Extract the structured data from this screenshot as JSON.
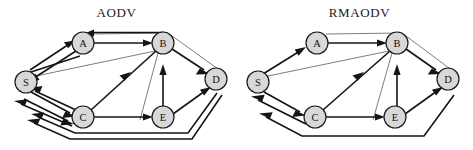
{
  "figure": {
    "type": "network-routing-diagram",
    "panels": [
      {
        "id": "aodv",
        "title": "AODV",
        "nodes": [
          {
            "id": "S",
            "label": "S",
            "x": 26,
            "y": 82,
            "r": 11
          },
          {
            "id": "A",
            "label": "A",
            "x": 83,
            "y": 43,
            "r": 11
          },
          {
            "id": "B",
            "label": "B",
            "x": 163,
            "y": 43,
            "r": 11
          },
          {
            "id": "C",
            "label": "C",
            "x": 83,
            "y": 117,
            "r": 11
          },
          {
            "id": "E",
            "label": "E",
            "x": 163,
            "y": 117,
            "r": 11
          },
          {
            "id": "D",
            "label": "D",
            "x": 216,
            "y": 79,
            "r": 11
          }
        ],
        "edges": [
          {
            "from": "S",
            "to": "A",
            "style": "bold",
            "direction": "forward"
          },
          {
            "from": "A",
            "to": "S",
            "style": "bold",
            "direction": "forward"
          },
          {
            "from": "A",
            "to": "S",
            "style": "bold",
            "direction": "forward"
          },
          {
            "from": "A",
            "to": "B",
            "style": "bold",
            "direction": "forward"
          },
          {
            "from": "B",
            "to": "A",
            "style": "bold",
            "direction": "forward"
          },
          {
            "from": "S",
            "to": "C",
            "style": "bold",
            "direction": "forward"
          },
          {
            "from": "S",
            "to": "C",
            "style": "bold",
            "direction": "forward"
          },
          {
            "from": "C",
            "to": "S",
            "style": "bold",
            "direction": "forward"
          },
          {
            "from": "C",
            "to": "S",
            "style": "bold",
            "direction": "forward"
          },
          {
            "from": "C",
            "to": "B",
            "style": "bold",
            "direction": "forward"
          },
          {
            "from": "C",
            "to": "E",
            "style": "bold",
            "direction": "forward"
          },
          {
            "from": "E",
            "to": "B",
            "style": "bold",
            "direction": "forward"
          },
          {
            "from": "B",
            "to": "D",
            "style": "bold",
            "direction": "forward"
          },
          {
            "from": "E",
            "to": "D",
            "style": "bold",
            "direction": "forward"
          },
          {
            "from": "D",
            "to": "S",
            "style": "bold",
            "direction": "forward",
            "routing": "bottom"
          },
          {
            "from": "D",
            "to": "S",
            "style": "bold",
            "direction": "forward",
            "routing": "bottom"
          },
          {
            "from": "A",
            "to": "D",
            "style": "thin",
            "direction": "none",
            "routing": "outer-top"
          },
          {
            "from": "S",
            "to": "B",
            "style": "thin",
            "direction": "none",
            "routing": "inner"
          },
          {
            "from": "B",
            "to": "E",
            "style": "thin",
            "direction": "none",
            "routing": "inner"
          }
        ]
      },
      {
        "id": "rmaodv",
        "title": "RMAODV",
        "nodes": [
          {
            "id": "S",
            "label": "S",
            "x": 22,
            "y": 82,
            "r": 11
          },
          {
            "id": "A",
            "label": "A",
            "x": 81,
            "y": 43,
            "r": 11
          },
          {
            "id": "B",
            "label": "B",
            "x": 161,
            "y": 43,
            "r": 11
          },
          {
            "id": "C",
            "label": "C",
            "x": 79,
            "y": 117,
            "r": 11
          },
          {
            "id": "E",
            "label": "E",
            "x": 159,
            "y": 117,
            "r": 11
          },
          {
            "id": "D",
            "label": "D",
            "x": 212,
            "y": 79,
            "r": 11
          }
        ],
        "edges": [
          {
            "from": "S",
            "to": "A",
            "style": "bold",
            "direction": "forward"
          },
          {
            "from": "A",
            "to": "B",
            "style": "bold",
            "direction": "forward"
          },
          {
            "from": "S",
            "to": "C",
            "style": "bold",
            "direction": "forward"
          },
          {
            "from": "C",
            "to": "S",
            "style": "bold",
            "direction": "forward"
          },
          {
            "from": "C",
            "to": "B",
            "style": "bold",
            "direction": "forward"
          },
          {
            "from": "C",
            "to": "E",
            "style": "bold",
            "direction": "forward"
          },
          {
            "from": "E",
            "to": "B",
            "style": "bold",
            "direction": "forward"
          },
          {
            "from": "B",
            "to": "D",
            "style": "bold",
            "direction": "forward"
          },
          {
            "from": "E",
            "to": "D",
            "style": "bold",
            "direction": "forward"
          },
          {
            "from": "D",
            "to": "S",
            "style": "bold",
            "direction": "forward",
            "routing": "bottom"
          },
          {
            "from": "A",
            "to": "D",
            "style": "thin",
            "direction": "none",
            "routing": "outer-top"
          },
          {
            "from": "S",
            "to": "B",
            "style": "thin",
            "direction": "none",
            "routing": "inner"
          },
          {
            "from": "B",
            "to": "E",
            "style": "thin",
            "direction": "none",
            "routing": "inner"
          }
        ]
      }
    ],
    "colors": {
      "node_fill": "#d8d8d8",
      "node_stroke": "#1a1a1a",
      "edge_bold": "#141414",
      "edge_thin": "#6e6e6e",
      "background": "#ffffff",
      "text": "#111111"
    }
  }
}
